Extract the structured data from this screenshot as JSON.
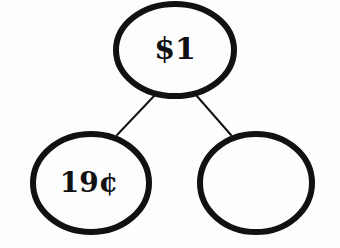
{
  "diagram": {
    "type": "binary-tree",
    "background_color": "#fdfdfd",
    "ink_color": "#111111",
    "canvas": {
      "width": 340,
      "height": 248
    },
    "nodes": [
      {
        "id": "root",
        "name": "root-node",
        "label": "$1",
        "empty": false,
        "cx": 175,
        "cy": 50,
        "rx": 59,
        "ry": 46,
        "stroke_width": 6,
        "font_size": 30,
        "label_dx": 0,
        "label_dy": 1
      },
      {
        "id": "left-child",
        "name": "left-child-node",
        "label": "19¢",
        "empty": false,
        "cx": 91,
        "cy": 183,
        "rx": 58,
        "ry": 49,
        "stroke_width": 6,
        "font_size": 28,
        "label_dx": -2,
        "label_dy": 1
      },
      {
        "id": "right-child",
        "name": "right-child-node",
        "label": "",
        "empty": true,
        "cx": 256,
        "cy": 183,
        "rx": 56,
        "ry": 49,
        "stroke_width": 6,
        "font_size": 28,
        "label_dx": 0,
        "label_dy": 1
      }
    ],
    "edges": [
      {
        "id": "root-to-left",
        "name": "edge-root-to-left-child",
        "from": "root",
        "to": "left-child",
        "x1": 155,
        "y1": 95,
        "x2": 117,
        "y2": 135,
        "stroke_width": 2
      },
      {
        "id": "root-to-right",
        "name": "edge-root-to-right-child",
        "from": "root",
        "to": "right-child",
        "x1": 196,
        "y1": 95,
        "x2": 231,
        "y2": 135,
        "stroke_width": 2
      }
    ]
  }
}
